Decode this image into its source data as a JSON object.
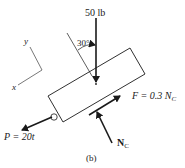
{
  "figure": {
    "caption": "(b)",
    "forces": {
      "weight": {
        "label": "50 lb"
      },
      "angle": {
        "label": "30°"
      },
      "pull": {
        "label": "P = 20t"
      },
      "friction": {
        "label_main": "F = 0.3 N",
        "label_sub": "C"
      },
      "normal": {
        "label_main": "N",
        "label_sub": "C"
      }
    },
    "axes": {
      "x_label": "x",
      "y_label": "y"
    },
    "colors": {
      "stroke": "#1a1a1a",
      "background": "#ffffff"
    }
  }
}
